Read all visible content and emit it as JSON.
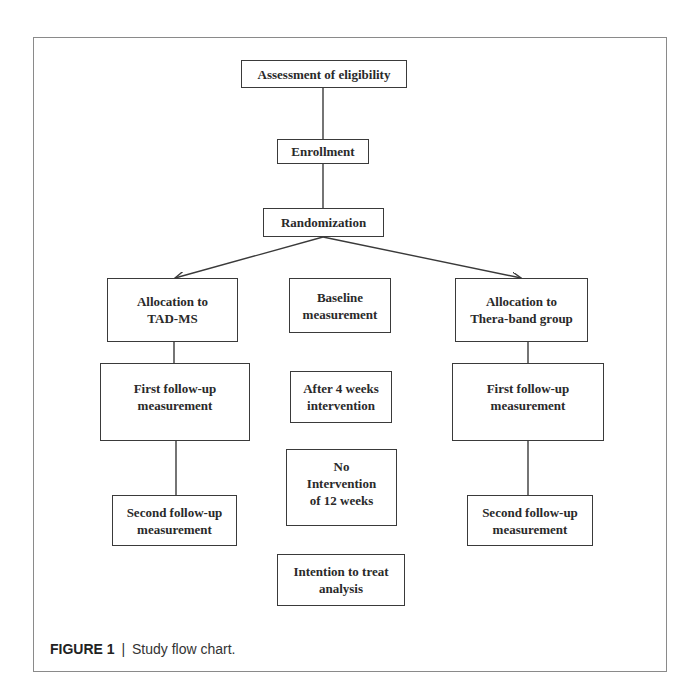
{
  "figure": {
    "caption_label": "FIGURE 1",
    "caption_separator": "|",
    "caption_text": "Study flow chart."
  },
  "colors": {
    "box_border": "#3a3a3a",
    "text": "#2a2a2a",
    "frame_border": "#8a8a8a",
    "background": "#ffffff"
  },
  "flow": {
    "assessment": "Assessment of eligibility",
    "enrollment": "Enrollment",
    "randomization": "Randomization",
    "left_branch": {
      "allocation": "Allocation to\nTAD-MS",
      "first_follow_up": "First follow-up\nmeasurement",
      "second_follow_up": "Second follow-up\nmeasurement"
    },
    "center_column": {
      "baseline": "Baseline\nmeasurement",
      "after_4_weeks": "After 4 weeks\nintervention",
      "no_intervention": "No\nIntervention\nof 12 weeks",
      "intention_to_treat": "Intention to treat\nanalysis"
    },
    "right_branch": {
      "allocation": "Allocation to\nThera-band group",
      "first_follow_up": "First follow-up\nmeasurement",
      "second_follow_up": "Second follow-up\nmeasurement"
    }
  },
  "edges": [
    {
      "from": "assessment",
      "to": "enrollment",
      "type": "line"
    },
    {
      "from": "enrollment",
      "to": "randomization",
      "type": "line"
    },
    {
      "from": "randomization",
      "to": "left_branch.allocation",
      "type": "arrow"
    },
    {
      "from": "randomization",
      "to": "right_branch.allocation",
      "type": "arrow"
    },
    {
      "from": "left_branch.allocation",
      "to": "left_branch.first_follow_up",
      "type": "line"
    },
    {
      "from": "left_branch.first_follow_up",
      "to": "left_branch.second_follow_up",
      "type": "line"
    },
    {
      "from": "right_branch.allocation",
      "to": "right_branch.first_follow_up",
      "type": "line"
    },
    {
      "from": "right_branch.first_follow_up",
      "to": "right_branch.second_follow_up",
      "type": "line"
    }
  ]
}
